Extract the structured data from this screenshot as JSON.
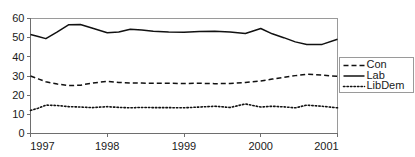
{
  "chart_data": {
    "type": "line",
    "title": "",
    "subtitle": "",
    "xlabel": "",
    "ylabel": "",
    "xlim": [
      1997.0,
      2001.0
    ],
    "ylim": [
      0,
      60
    ],
    "grid": false,
    "legend_position": "right-outside",
    "xtick_labels": [
      "1997",
      "1998",
      "1999",
      "2000",
      "2001"
    ],
    "xtick_values": [
      1997,
      1998,
      1999,
      2000,
      2001
    ],
    "ytick_labels": [
      "0",
      "10",
      "20",
      "30",
      "40",
      "50",
      "60"
    ],
    "ytick_values": [
      0,
      10,
      20,
      30,
      40,
      50,
      60
    ],
    "x": [
      1997.0,
      1997.1,
      1997.2,
      1997.35,
      1997.5,
      1997.65,
      1997.8,
      1998.0,
      1998.15,
      1998.3,
      1998.45,
      1998.6,
      1998.8,
      1999.0,
      1999.2,
      1999.4,
      1999.6,
      1999.8,
      2000.0,
      2000.15,
      2000.3,
      2000.45,
      2000.6,
      2000.8,
      2001.0
    ],
    "series": [
      {
        "name": "Con",
        "style": "dashed",
        "color": "#111111",
        "values": [
          30.0,
          28.5,
          27.0,
          25.8,
          25.0,
          25.2,
          26.3,
          27.2,
          26.6,
          26.4,
          26.3,
          26.2,
          26.2,
          26.1,
          26.2,
          26.0,
          26.1,
          26.6,
          27.4,
          28.4,
          29.3,
          30.2,
          30.9,
          30.5,
          29.8
        ]
      },
      {
        "name": "Lab",
        "style": "solid",
        "color": "#111111",
        "values": [
          51.6,
          50.6,
          49.5,
          53.0,
          56.8,
          56.9,
          55.0,
          52.6,
          53.0,
          54.4,
          54.0,
          53.4,
          53.0,
          52.8,
          53.2,
          53.4,
          53.0,
          52.2,
          54.8,
          52.0,
          50.0,
          47.8,
          46.4,
          46.5,
          49.2
        ]
      },
      {
        "name": "LibDem",
        "style": "dotted",
        "color": "#111111",
        "values": [
          12.0,
          13.2,
          14.8,
          14.6,
          14.0,
          13.8,
          13.5,
          14.0,
          13.6,
          13.4,
          13.6,
          13.5,
          13.5,
          13.4,
          13.8,
          14.2,
          13.6,
          15.4,
          13.8,
          14.2,
          13.9,
          13.4,
          14.8,
          14.2,
          13.4
        ]
      }
    ]
  },
  "legend": {
    "entries": [
      {
        "label": "Con",
        "style": "dashed"
      },
      {
        "label": "Lab",
        "style": "solid"
      },
      {
        "label": "LibDem",
        "style": "dotted"
      }
    ]
  },
  "colors": {
    "line": "#111111",
    "frame": "#9a9a9a",
    "axis": "#6e6e6e",
    "text": "#1a1a1a",
    "background": "#ffffff"
  }
}
